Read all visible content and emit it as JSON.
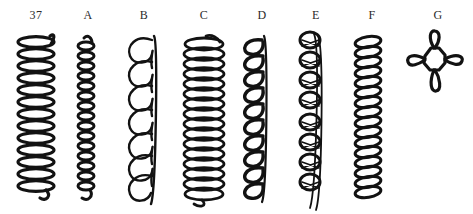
{
  "plate": {
    "background_color": "#ffffff",
    "ink_color": "#121212",
    "label_color": "#2b2b2b"
  },
  "figures": [
    {
      "label": "37",
      "name": "figure-37",
      "description": "tight coil of flattened horizontal loops",
      "x": 14,
      "label_x": 16,
      "art_x": 10,
      "top": 36,
      "bottom": 202,
      "coil_width": 42,
      "turns": 13,
      "style": "flat-ellipse-coil"
    },
    {
      "label": "A",
      "name": "figure-a",
      "description": "narrow tight coil with small round loops",
      "x": 80,
      "label_x": 68,
      "art_x": 70,
      "top": 40,
      "bottom": 202,
      "coil_width": 22,
      "turns": 16,
      "style": "narrow-coil"
    },
    {
      "label": "B",
      "name": "figure-b",
      "description": "open loose spiral with large open loops",
      "x": 136,
      "label_x": 124,
      "art_x": 118,
      "top": 36,
      "bottom": 202,
      "coil_width": 40,
      "turns": 8,
      "style": "open-loop-spiral"
    },
    {
      "label": "C",
      "name": "figure-c",
      "description": "dense wide coil with overlapping elliptical turns",
      "x": 196,
      "label_x": 184,
      "art_x": 176,
      "top": 36,
      "bottom": 202,
      "coil_width": 46,
      "turns": 17,
      "style": "dense-ellipse-coil"
    },
    {
      "label": "D",
      "name": "figure-d",
      "description": "u-shaped loops along a straight right edge",
      "x": 254,
      "label_x": 242,
      "art_x": 234,
      "top": 38,
      "bottom": 202,
      "coil_width": 30,
      "turns": 11,
      "style": "u-loop-column"
    },
    {
      "label": "E",
      "name": "figure-e",
      "description": "circular loops crossed by a vertical strand",
      "x": 308,
      "label_x": 296,
      "art_x": 290,
      "top": 32,
      "bottom": 202,
      "coil_width": 30,
      "turns": 10,
      "style": "ringed-strand"
    },
    {
      "label": "F",
      "name": "figure-f",
      "description": "dense narrow coil with slanted loops",
      "x": 364,
      "label_x": 352,
      "art_x": 348,
      "top": 36,
      "bottom": 202,
      "coil_width": 32,
      "turns": 16,
      "style": "slanted-coil"
    },
    {
      "label": "G",
      "name": "figure-g",
      "description": "cross shaped rosette, central ring with four petal loops",
      "x": 430,
      "label_x": 418,
      "art_x": 398,
      "top": 44,
      "bottom": 110,
      "coil_width": 62,
      "turns": 4,
      "style": "four-petal-rosette"
    }
  ]
}
